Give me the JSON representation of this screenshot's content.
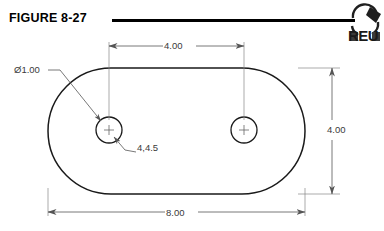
{
  "figure": {
    "title": "FIGURE 8-27",
    "rule": "horizontal-rule"
  },
  "watermark": {
    "text": "REU",
    "description": "cropped-circular-logo"
  },
  "drawing": {
    "type": "engineering-drawing",
    "shape": "obround-slot-plate",
    "units": "inches",
    "outline": {
      "name": "slot-outline",
      "left": 48,
      "right": 305,
      "top": 68,
      "bottom": 194,
      "corner_radius": 63
    },
    "holes": [
      {
        "name": "left-hole",
        "cx": 109,
        "cy": 130,
        "r": 13,
        "diameter": "1.00"
      },
      {
        "name": "right-hole",
        "cx": 244,
        "cy": 130,
        "r": 13,
        "diameter": "1.00"
      }
    ],
    "dimensions": [
      {
        "name": "hole-spacing",
        "label": "4.00",
        "orientation": "horizontal",
        "position": "top"
      },
      {
        "name": "overall-width",
        "label": "8.00",
        "orientation": "horizontal",
        "position": "bottom"
      },
      {
        "name": "overall-height",
        "label": "4.00",
        "orientation": "vertical",
        "position": "right"
      }
    ],
    "leaders": [
      {
        "name": "diameter-callout",
        "label": "Ø1.00",
        "target": "left-hole"
      },
      {
        "name": "hole-note-callout",
        "label": "4,4.5",
        "target": "left-hole"
      }
    ],
    "colors": {
      "outline": "#1a1a1a",
      "dimension": "#555555",
      "text": "#3a3a3a",
      "title": "#000000",
      "background": "#ffffff"
    }
  }
}
